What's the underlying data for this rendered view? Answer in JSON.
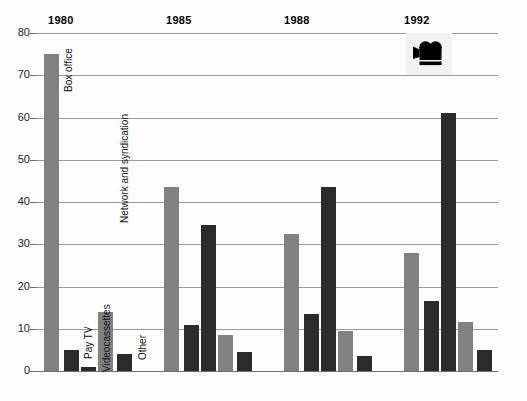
{
  "chart_data": {
    "type": "bar",
    "title": "",
    "subtitle": "",
    "xlabel": "",
    "ylabel": "",
    "ylim": [
      0,
      80
    ],
    "ytick_step": 10,
    "yticks": [
      "0",
      "10",
      "20",
      "30",
      "40",
      "50",
      "60",
      "70",
      "80"
    ],
    "grid": true,
    "legend": "in-chart rotated labels on first group",
    "categories": [
      "1980",
      "1985",
      "1988",
      "1992"
    ],
    "series": [
      {
        "name": "Box office",
        "color": "#818181",
        "values": [
          75,
          43.5,
          32.5,
          28
        ]
      },
      {
        "name": "Pay TV",
        "color": "#2b2b2b",
        "values": [
          5,
          11,
          13.5,
          16.5
        ]
      },
      {
        "name": "Videocassettes",
        "color": "#2b2b2b",
        "values": [
          1,
          34.5,
          43.5,
          61
        ]
      },
      {
        "name": "Network and syndication",
        "color": "#818181",
        "values": [
          14,
          8.5,
          9.5,
          11.5
        ]
      },
      {
        "name": "Other",
        "color": "#2b2b2b",
        "values": [
          4,
          4.5,
          3.5,
          5
        ]
      }
    ],
    "annotations": [
      {
        "name": "movie-camera-icon",
        "position": "top-right"
      }
    ]
  },
  "axis": {
    "y_ticks": [
      {
        "label": "80",
        "value": 80
      },
      {
        "label": "70",
        "value": 70
      },
      {
        "label": "60",
        "value": 60
      },
      {
        "label": "50",
        "value": 50
      },
      {
        "label": "40",
        "value": 40
      },
      {
        "label": "30",
        "value": 30
      },
      {
        "label": "20",
        "value": 20
      },
      {
        "label": "10",
        "value": 10
      },
      {
        "label": "0",
        "value": 0
      }
    ]
  },
  "groups": [
    {
      "year": "1980",
      "bars": [
        {
          "label": "Box office",
          "value": 75,
          "tone": "gray"
        },
        {
          "label": "Pay TV",
          "value": 5,
          "tone": "dark"
        },
        {
          "label": "Videocassettes",
          "value": 1,
          "tone": "dark"
        },
        {
          "label": "Network and syndication",
          "value": 14,
          "tone": "gray"
        },
        {
          "label": "Other",
          "value": 4,
          "tone": "dark"
        }
      ]
    },
    {
      "year": "1985",
      "bars": [
        {
          "label": "Box office",
          "value": 43.5,
          "tone": "gray"
        },
        {
          "label": "Pay TV",
          "value": 11,
          "tone": "dark"
        },
        {
          "label": "Videocassettes",
          "value": 34.5,
          "tone": "dark"
        },
        {
          "label": "Network and syndication",
          "value": 8.5,
          "tone": "gray"
        },
        {
          "label": "Other",
          "value": 4.5,
          "tone": "dark"
        }
      ]
    },
    {
      "year": "1988",
      "bars": [
        {
          "label": "Box office",
          "value": 32.5,
          "tone": "gray"
        },
        {
          "label": "Pay TV",
          "value": 13.5,
          "tone": "dark"
        },
        {
          "label": "Videocassettes",
          "value": 43.5,
          "tone": "dark"
        },
        {
          "label": "Network and syndication",
          "value": 9.5,
          "tone": "gray"
        },
        {
          "label": "Other",
          "value": 3.5,
          "tone": "dark"
        }
      ]
    },
    {
      "year": "1992",
      "bars": [
        {
          "label": "Box office",
          "value": 28,
          "tone": "gray"
        },
        {
          "label": "Pay TV",
          "value": 16.5,
          "tone": "dark"
        },
        {
          "label": "Videocassettes",
          "value": 61,
          "tone": "dark"
        },
        {
          "label": "Network and syndication",
          "value": 11.5,
          "tone": "gray"
        },
        {
          "label": "Other",
          "value": 5,
          "tone": "dark"
        }
      ]
    }
  ],
  "series_labels": [
    "Box office",
    "Pay TV",
    "Videocassettes",
    "Network and syndication",
    "Other"
  ],
  "icon": {
    "name": "movie-camera-icon"
  },
  "colors": {
    "bar_gray": "#818181",
    "bar_dark": "#2b2b2b",
    "gridline": "#9a9a9a",
    "text": "#111111",
    "background": "#ffffff"
  }
}
